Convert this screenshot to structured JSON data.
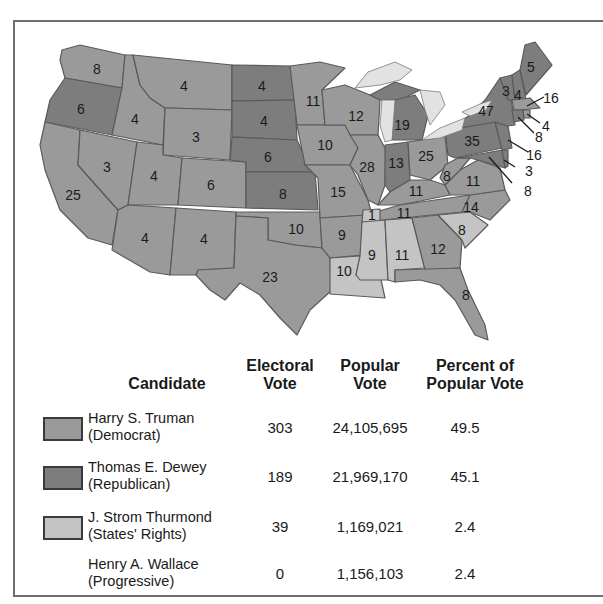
{
  "colors": {
    "democrat": "#9a9a9a",
    "republican": "#7d7d7d",
    "states_rights": "#c4c4c4",
    "lakes": "#e2e2e2",
    "border": "#5a5a5a"
  },
  "map": {
    "states": [
      {
        "abbr": "WA",
        "ev": "8",
        "party": "democrat"
      },
      {
        "abbr": "OR",
        "ev": "6",
        "party": "republican"
      },
      {
        "abbr": "CA",
        "ev": "25",
        "party": "democrat"
      },
      {
        "abbr": "NV",
        "ev": "3",
        "party": "democrat"
      },
      {
        "abbr": "ID",
        "ev": "4",
        "party": "democrat"
      },
      {
        "abbr": "MT",
        "ev": "4",
        "party": "democrat"
      },
      {
        "abbr": "WY",
        "ev": "3",
        "party": "democrat"
      },
      {
        "abbr": "UT",
        "ev": "4",
        "party": "democrat"
      },
      {
        "abbr": "CO",
        "ev": "6",
        "party": "democrat"
      },
      {
        "abbr": "AZ",
        "ev": "4",
        "party": "democrat"
      },
      {
        "abbr": "NM",
        "ev": "4",
        "party": "democrat"
      },
      {
        "abbr": "ND",
        "ev": "4",
        "party": "republican"
      },
      {
        "abbr": "SD",
        "ev": "4",
        "party": "republican"
      },
      {
        "abbr": "NE",
        "ev": "6",
        "party": "republican"
      },
      {
        "abbr": "KS",
        "ev": "8",
        "party": "republican"
      },
      {
        "abbr": "OK",
        "ev": "10",
        "party": "democrat"
      },
      {
        "abbr": "TX",
        "ev": "23",
        "party": "democrat"
      },
      {
        "abbr": "MN",
        "ev": "11",
        "party": "democrat"
      },
      {
        "abbr": "IA",
        "ev": "10",
        "party": "democrat"
      },
      {
        "abbr": "MO",
        "ev": "15",
        "party": "democrat"
      },
      {
        "abbr": "AR",
        "ev": "9",
        "party": "democrat"
      },
      {
        "abbr": "LA",
        "ev": "10",
        "party": "states_rights"
      },
      {
        "abbr": "WI",
        "ev": "12",
        "party": "democrat"
      },
      {
        "abbr": "IL",
        "ev": "28",
        "party": "democrat"
      },
      {
        "abbr": "MI",
        "ev": "19",
        "party": "republican"
      },
      {
        "abbr": "IN",
        "ev": "13",
        "party": "republican"
      },
      {
        "abbr": "OH",
        "ev": "25",
        "party": "democrat"
      },
      {
        "abbr": "KY",
        "ev": "11",
        "party": "democrat"
      },
      {
        "abbr": "TN",
        "ev": "11",
        "party": "democrat",
        "note": "1 elector to Thurmond"
      },
      {
        "abbr": "TN-split",
        "ev": "1",
        "party": "states_rights"
      },
      {
        "abbr": "MS",
        "ev": "9",
        "party": "states_rights"
      },
      {
        "abbr": "AL",
        "ev": "11",
        "party": "states_rights"
      },
      {
        "abbr": "GA",
        "ev": "12",
        "party": "democrat"
      },
      {
        "abbr": "FL",
        "ev": "8",
        "party": "democrat"
      },
      {
        "abbr": "SC",
        "ev": "8",
        "party": "states_rights"
      },
      {
        "abbr": "NC",
        "ev": "14",
        "party": "democrat"
      },
      {
        "abbr": "VA",
        "ev": "11",
        "party": "democrat"
      },
      {
        "abbr": "WV",
        "ev": "8",
        "party": "democrat"
      },
      {
        "abbr": "PA",
        "ev": "35",
        "party": "republican"
      },
      {
        "abbr": "NY",
        "ev": "47",
        "party": "republican"
      },
      {
        "abbr": "VT",
        "ev": "3",
        "party": "republican"
      },
      {
        "abbr": "NH",
        "ev": "4",
        "party": "republican"
      },
      {
        "abbr": "ME",
        "ev": "5",
        "party": "republican"
      },
      {
        "abbr": "MA",
        "ev": "16",
        "party": "democrat"
      },
      {
        "abbr": "RI",
        "ev": "4",
        "party": "democrat"
      },
      {
        "abbr": "CT",
        "ev": "8",
        "party": "republican"
      },
      {
        "abbr": "NJ",
        "ev": "16",
        "party": "republican"
      },
      {
        "abbr": "DE",
        "ev": "3",
        "party": "republican"
      },
      {
        "abbr": "MD",
        "ev": "8",
        "party": "republican"
      }
    ]
  },
  "table": {
    "headers": {
      "candidate": "Candidate",
      "electoral_1": "Electoral",
      "electoral_2": "Vote",
      "popular_1": "Popular",
      "popular_2": "Vote",
      "percent_1": "Percent of",
      "percent_2": "Popular Vote"
    },
    "rows": [
      {
        "name": "Harry S. Truman",
        "party": "(Democrat)",
        "electoral": "303",
        "popular": "24,105,695",
        "percent": "49.5",
        "swatch": "democrat"
      },
      {
        "name": "Thomas E. Dewey",
        "party": "(Republican)",
        "electoral": "189",
        "popular": "21,969,170",
        "percent": "45.1",
        "swatch": "republican"
      },
      {
        "name": "J. Strom Thurmond",
        "party": "(States' Rights)",
        "electoral": "39",
        "popular": "1,169,021",
        "percent": "2.4",
        "swatch": "states_rights"
      },
      {
        "name": "Henry A. Wallace",
        "party": "(Progressive)",
        "electoral": "0",
        "popular": "1,156,103",
        "percent": "2.4",
        "swatch": null
      }
    ]
  }
}
